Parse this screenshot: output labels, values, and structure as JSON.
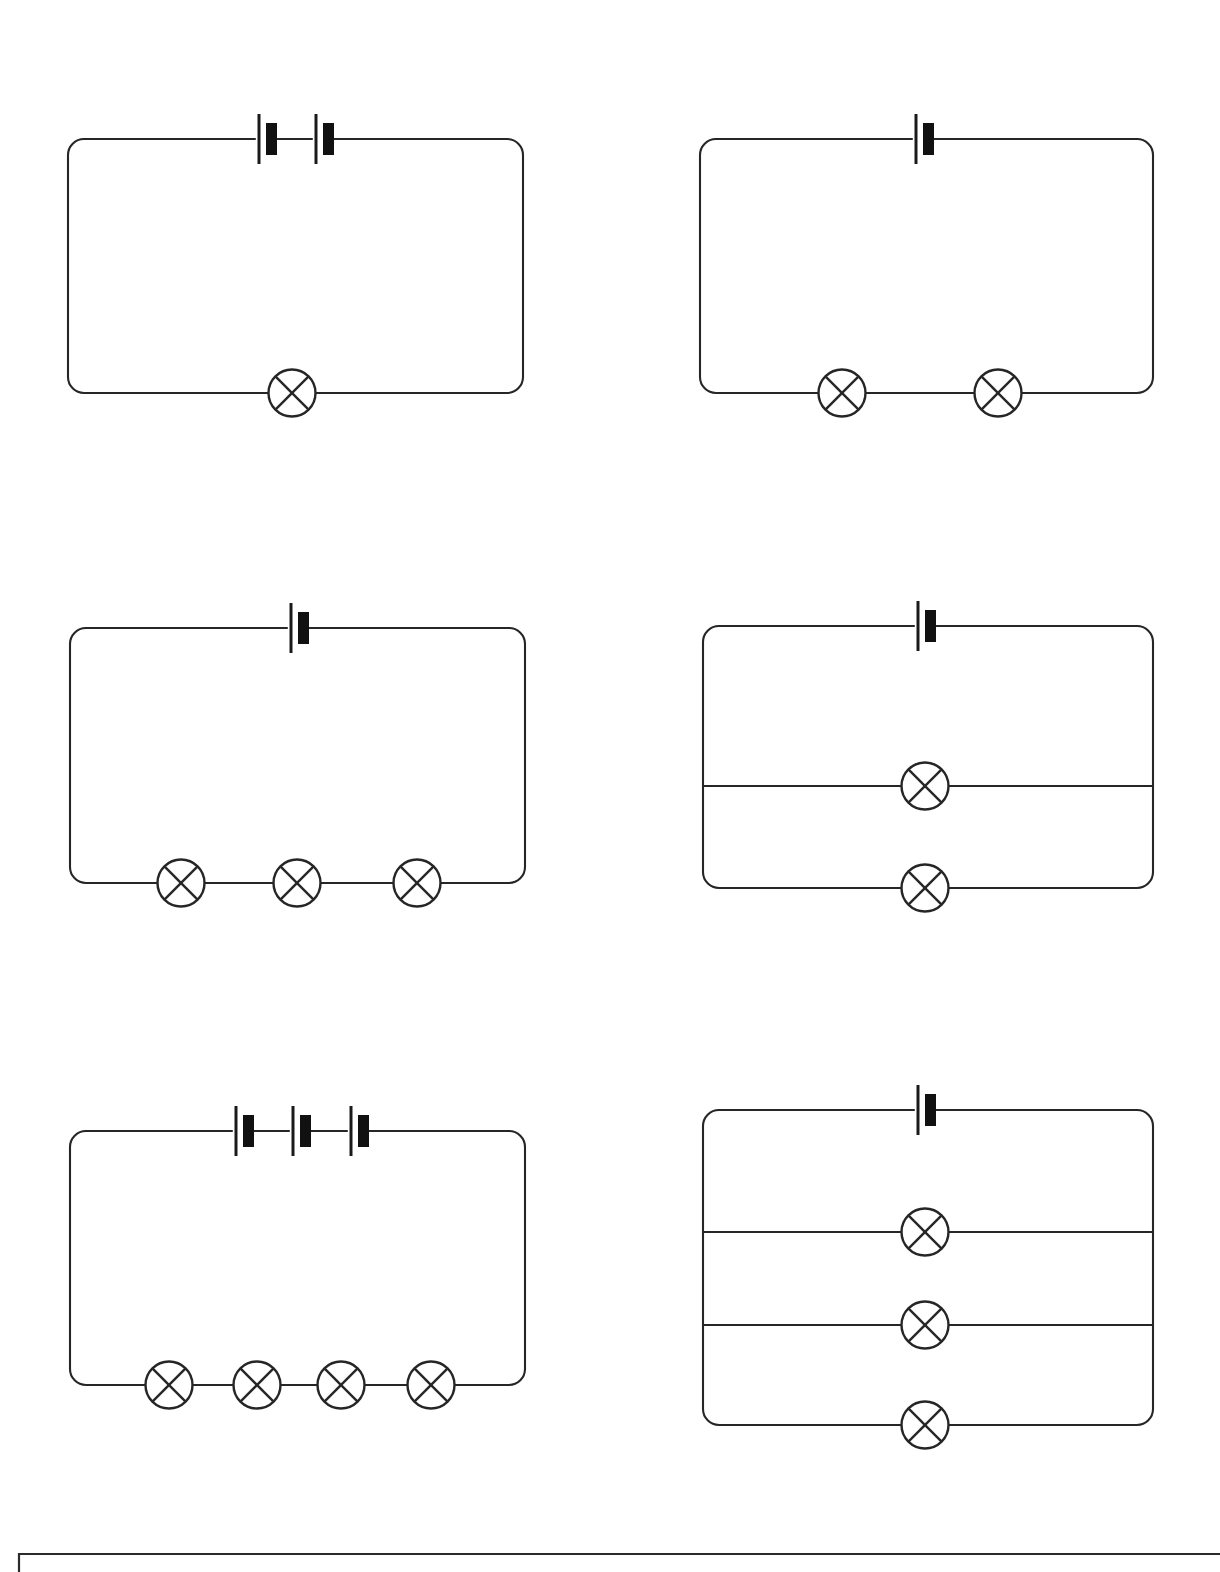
{
  "page": {
    "width": 1220,
    "height": 1572,
    "background_color": "#ffffff",
    "ink_color": "#262626"
  },
  "symbols": {
    "cell": {
      "name": "cell-symbol",
      "description": "Battery cell: long thin plate line plus short thick filled plate",
      "long_plate_height": 50,
      "short_plate_width": 11,
      "short_plate_height": 32,
      "gap": 12
    },
    "lamp": {
      "name": "lamp-symbol",
      "description": "Filament lamp: circle with a cross (X) inscribed",
      "radius": 23.5
    }
  },
  "circuits": [
    {
      "id": "circuit-1",
      "label": "Circuit 1",
      "position": "top-left",
      "frame": {
        "x": 68,
        "y": 139,
        "w": 455,
        "h": 254,
        "corner_radius": 16
      },
      "cells": {
        "count": 2,
        "centers_x": [
          266,
          323
        ],
        "y": 139
      },
      "lamps": {
        "count": 1,
        "arrangement": "series",
        "centers_x": [
          292
        ],
        "y": 393
      },
      "branches": [],
      "summary": "2 cells in series with 1 lamp"
    },
    {
      "id": "circuit-2",
      "label": "Circuit 2",
      "position": "top-right",
      "frame": {
        "x": 700,
        "y": 139,
        "w": 453,
        "h": 254,
        "corner_radius": 16
      },
      "cells": {
        "count": 1,
        "centers_x": [
          923
        ],
        "y": 139
      },
      "lamps": {
        "count": 2,
        "arrangement": "series",
        "centers_x": [
          842,
          998
        ],
        "y": 393
      },
      "branches": [],
      "summary": "1 cell in series with 2 lamps"
    },
    {
      "id": "circuit-3",
      "label": "Circuit 3",
      "position": "middle-left",
      "frame": {
        "x": 70,
        "y": 628,
        "w": 455,
        "h": 255,
        "corner_radius": 16
      },
      "cells": {
        "count": 1,
        "centers_x": [
          298
        ],
        "y": 628
      },
      "lamps": {
        "count": 3,
        "arrangement": "series",
        "centers_x": [
          181,
          297,
          417
        ],
        "y": 883
      },
      "branches": [],
      "summary": "1 cell in series with 3 lamps"
    },
    {
      "id": "circuit-4",
      "label": "Circuit 4",
      "position": "middle-right",
      "frame": {
        "x": 703,
        "y": 626,
        "w": 450,
        "h": 262,
        "corner_radius": 16
      },
      "cells": {
        "count": 1,
        "centers_x": [
          925
        ],
        "y": 626
      },
      "lamps": {
        "count": 2,
        "arrangement": "parallel",
        "centers_x": [
          925,
          925
        ],
        "centers_y": [
          786,
          888
        ]
      },
      "branches": [
        {
          "y": 786
        }
      ],
      "summary": "1 cell with 2 lamps in parallel"
    },
    {
      "id": "circuit-5",
      "label": "Circuit 5",
      "position": "bottom-left",
      "frame": {
        "x": 70,
        "y": 1131,
        "w": 455,
        "h": 254,
        "corner_radius": 16
      },
      "cells": {
        "count": 3,
        "centers_x": [
          243,
          300,
          358
        ],
        "y": 1131
      },
      "lamps": {
        "count": 4,
        "arrangement": "series",
        "centers_x": [
          169,
          257,
          341,
          431
        ],
        "y": 1385
      },
      "branches": [],
      "summary": "3 cells in series with 4 lamps"
    },
    {
      "id": "circuit-6",
      "label": "Circuit 6",
      "position": "bottom-right",
      "frame": {
        "x": 703,
        "y": 1110,
        "w": 450,
        "h": 315,
        "corner_radius": 16
      },
      "cells": {
        "count": 1,
        "centers_x": [
          925
        ],
        "y": 1110
      },
      "lamps": {
        "count": 3,
        "arrangement": "parallel",
        "centers_x": [
          925,
          925,
          925
        ],
        "centers_y": [
          1232,
          1325,
          1425
        ]
      },
      "branches": [
        {
          "y": 1232
        },
        {
          "y": 1325
        }
      ],
      "summary": "1 cell with 3 lamps in parallel"
    }
  ],
  "answer_box": {
    "name": "answer-box",
    "x": 19,
    "y": 1554,
    "w": 1201,
    "h": 60,
    "note": "Bordered box cropped by the bottom edge of the page"
  }
}
